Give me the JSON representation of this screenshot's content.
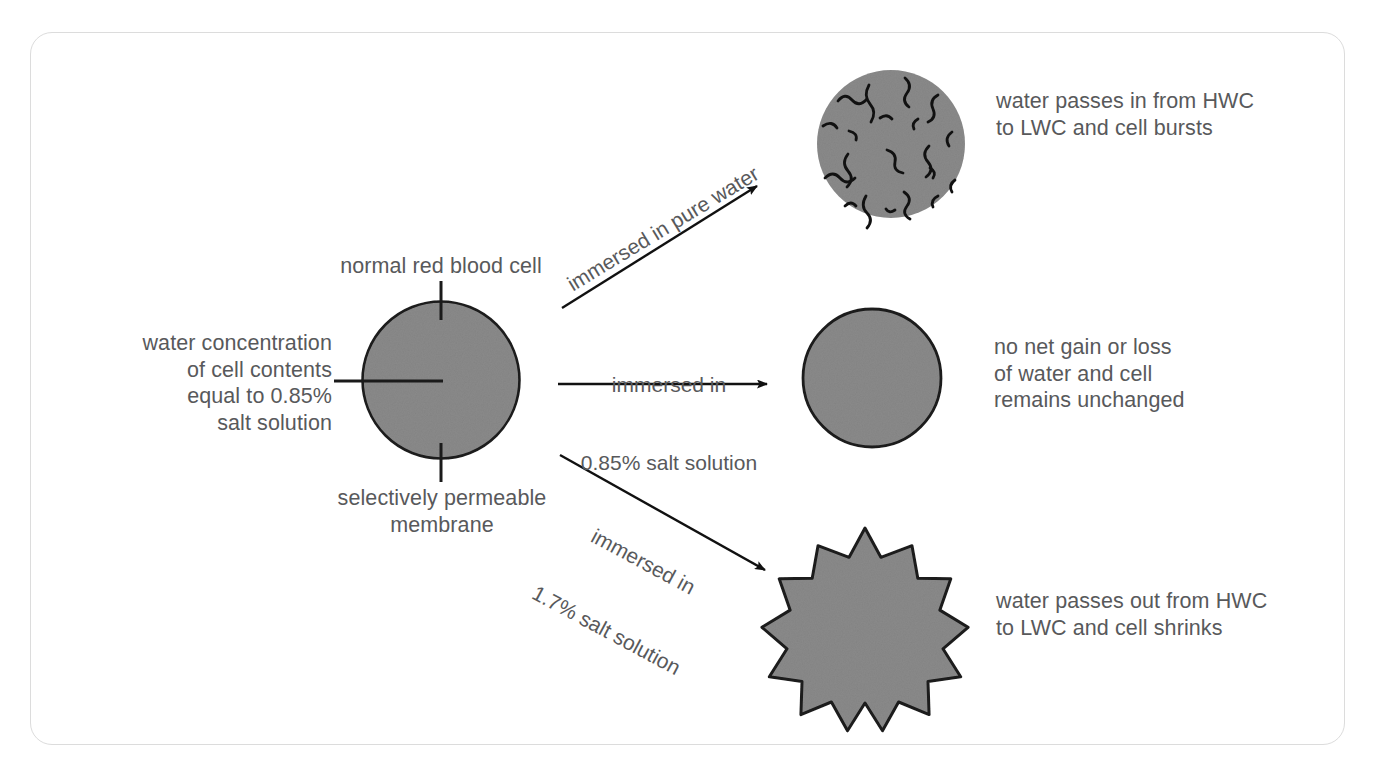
{
  "figure": {
    "title_semantic": "osmosis-in-red-blood-cells-diagram",
    "border_color": "#dcdcdc",
    "cell_fill_color": "#8a8a8a",
    "cell_outline_color": "#1a1a1a",
    "text_color": "#58595b"
  },
  "labels": {
    "normal_cell": "normal red blood cell",
    "water_concentration": "water concentration\nof cell contents\nequal to 0.85%\nsalt solution",
    "membrane": "selectively permeable\nmembrane"
  },
  "arrows": [
    {
      "id": "arrow-pure-water",
      "label": "immersed in pure water",
      "lines": [
        "immersed in pure water"
      ],
      "rotation_deg": -31,
      "direction": "up-right"
    },
    {
      "id": "arrow-isotonic",
      "label": "immersed in 0.85% salt solution",
      "lines": [
        "immersed in",
        "0.85% salt solution"
      ],
      "rotation_deg": 0,
      "direction": "right"
    },
    {
      "id": "arrow-hypertonic",
      "label": "immersed in 1.7% salt solution",
      "lines": [
        "immersed in",
        "1.7% salt solution"
      ],
      "rotation_deg": 28,
      "direction": "down-right"
    }
  ],
  "outcomes": [
    {
      "id": "outcome-burst",
      "cell_state": "burst",
      "lines": [
        "water passes in from HWC",
        "to LWC and cell bursts"
      ],
      "text": "water passes in from HWC\nto LWC and cell bursts"
    },
    {
      "id": "outcome-unchanged",
      "cell_state": "unchanged",
      "lines": [
        "no net gain or loss",
        "of water and cell",
        "remains unchanged"
      ],
      "text": "no net gain or loss\nof water and cell\nremains unchanged"
    },
    {
      "id": "outcome-shrunk",
      "cell_state": "crenated",
      "lines": [
        "water passes out from HWC",
        "to LWC and cell shrinks"
      ],
      "text": "water passes out from HWC\nto LWC and cell shrinks"
    }
  ]
}
